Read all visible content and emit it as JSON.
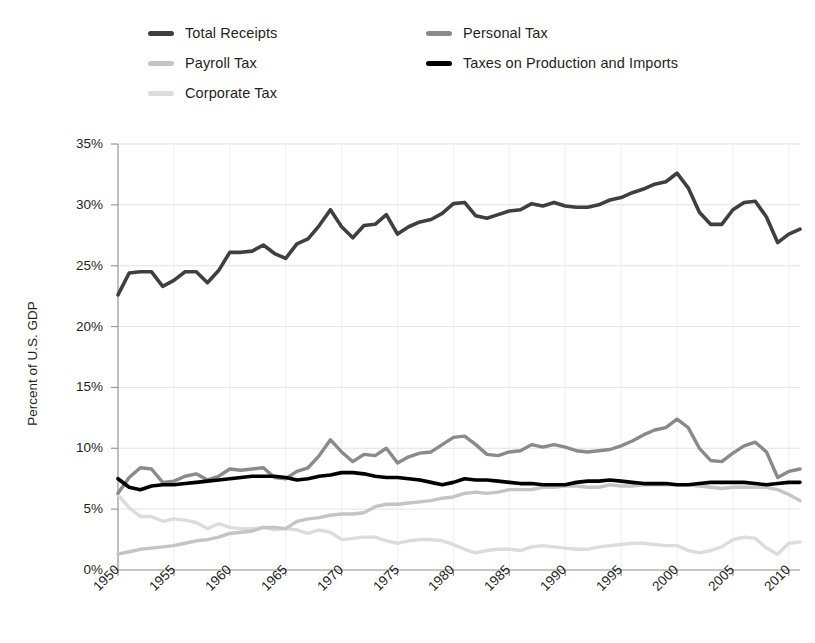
{
  "chart_data": {
    "type": "line",
    "title": "",
    "xlabel": "",
    "ylabel": "Percent of U.S. GDP",
    "xlim": [
      1950,
      2011
    ],
    "ylim": [
      0,
      35
    ],
    "ytick_values": [
      0,
      5,
      10,
      15,
      20,
      25,
      30,
      35
    ],
    "ytick_labels": [
      "0%",
      "5%",
      "10%",
      "15%",
      "20%",
      "25%",
      "30%",
      "35%"
    ],
    "xtick_values": [
      1950,
      1955,
      1960,
      1965,
      1970,
      1975,
      1980,
      1985,
      1990,
      1995,
      2000,
      2005,
      2010
    ],
    "xtick_labels": [
      "1950",
      "1955",
      "1960",
      "1965",
      "1970",
      "1975",
      "1980",
      "1985",
      "1990",
      "1995",
      "2000",
      "2005",
      "2010"
    ],
    "grid": true,
    "legend_position": "top",
    "x": [
      1950,
      1951,
      1952,
      1953,
      1954,
      1955,
      1956,
      1957,
      1958,
      1959,
      1960,
      1961,
      1962,
      1963,
      1964,
      1965,
      1966,
      1967,
      1968,
      1969,
      1970,
      1971,
      1972,
      1973,
      1974,
      1975,
      1976,
      1977,
      1978,
      1979,
      1980,
      1981,
      1982,
      1983,
      1984,
      1985,
      1986,
      1987,
      1988,
      1989,
      1990,
      1991,
      1992,
      1993,
      1994,
      1995,
      1996,
      1997,
      1998,
      1999,
      2000,
      2001,
      2002,
      2003,
      2004,
      2005,
      2006,
      2007,
      2008,
      2009,
      2010,
      2011
    ],
    "series": [
      {
        "name": "Total Receipts",
        "color": "#3f3f3f",
        "width": 3.6,
        "values": [
          22.6,
          24.4,
          24.5,
          24.5,
          23.3,
          23.8,
          24.5,
          24.5,
          23.6,
          24.6,
          26.1,
          26.1,
          26.2,
          26.7,
          26.0,
          25.6,
          26.8,
          27.2,
          28.3,
          29.6,
          28.2,
          27.3,
          28.3,
          28.4,
          29.2,
          27.6,
          28.2,
          28.6,
          28.8,
          29.3,
          30.1,
          30.2,
          29.1,
          28.9,
          29.2,
          29.5,
          29.6,
          30.1,
          29.9,
          30.2,
          29.9,
          29.8,
          29.8,
          30.0,
          30.4,
          30.6,
          31.0,
          31.3,
          31.7,
          31.9,
          32.6,
          31.4,
          29.4,
          28.4,
          28.4,
          29.6,
          30.2,
          30.3,
          29.0,
          26.9,
          27.6,
          28.0
        ]
      },
      {
        "name": "Personal Tax",
        "color": "#8a8a8a",
        "width": 3.4,
        "values": [
          6.3,
          7.6,
          8.4,
          8.3,
          7.2,
          7.3,
          7.7,
          7.9,
          7.4,
          7.7,
          8.3,
          8.2,
          8.3,
          8.4,
          7.6,
          7.5,
          8.1,
          8.4,
          9.4,
          10.7,
          9.7,
          8.9,
          9.5,
          9.4,
          10.0,
          8.8,
          9.3,
          9.6,
          9.7,
          10.3,
          10.9,
          11.0,
          10.3,
          9.5,
          9.4,
          9.7,
          9.8,
          10.3,
          10.1,
          10.3,
          10.1,
          9.8,
          9.7,
          9.8,
          9.9,
          10.2,
          10.6,
          11.1,
          11.5,
          11.7,
          12.4,
          11.7,
          10.0,
          9.0,
          8.9,
          9.6,
          10.2,
          10.5,
          9.7,
          7.6,
          8.1,
          8.3
        ]
      },
      {
        "name": "Payroll Tax",
        "color": "#c4c4c4",
        "width": 3.4,
        "values": [
          1.3,
          1.5,
          1.7,
          1.8,
          1.9,
          2.0,
          2.2,
          2.4,
          2.5,
          2.7,
          3.0,
          3.1,
          3.2,
          3.5,
          3.5,
          3.4,
          4.0,
          4.2,
          4.3,
          4.5,
          4.6,
          4.6,
          4.7,
          5.2,
          5.4,
          5.4,
          5.5,
          5.6,
          5.7,
          5.9,
          6.0,
          6.3,
          6.4,
          6.3,
          6.4,
          6.6,
          6.6,
          6.6,
          6.8,
          6.8,
          6.9,
          6.9,
          6.8,
          6.8,
          7.0,
          6.9,
          6.9,
          7.0,
          7.0,
          7.0,
          7.0,
          7.0,
          6.9,
          6.8,
          6.7,
          6.8,
          6.8,
          6.8,
          6.8,
          6.6,
          6.2,
          5.7
        ]
      },
      {
        "name": "Corporate Tax",
        "color": "#dcdcdc",
        "width": 3.4,
        "values": [
          6.2,
          5.1,
          4.4,
          4.4,
          4.0,
          4.2,
          4.1,
          3.9,
          3.4,
          3.8,
          3.5,
          3.4,
          3.4,
          3.5,
          3.3,
          3.4,
          3.3,
          3.0,
          3.3,
          3.1,
          2.5,
          2.6,
          2.7,
          2.7,
          2.4,
          2.2,
          2.4,
          2.5,
          2.5,
          2.4,
          2.1,
          1.7,
          1.4,
          1.6,
          1.7,
          1.7,
          1.6,
          1.9,
          2.0,
          1.9,
          1.8,
          1.7,
          1.7,
          1.9,
          2.0,
          2.1,
          2.2,
          2.2,
          2.1,
          2.0,
          2.0,
          1.6,
          1.4,
          1.6,
          1.9,
          2.5,
          2.7,
          2.6,
          1.8,
          1.3,
          2.2,
          2.3
        ]
      },
      {
        "name": "Taxes on Production and Imports",
        "color": "#000000",
        "width": 3.6,
        "values": [
          7.5,
          6.8,
          6.6,
          6.9,
          7.0,
          7.0,
          7.1,
          7.2,
          7.3,
          7.4,
          7.5,
          7.6,
          7.7,
          7.7,
          7.7,
          7.6,
          7.4,
          7.5,
          7.7,
          7.8,
          8.0,
          8.0,
          7.9,
          7.7,
          7.6,
          7.6,
          7.5,
          7.4,
          7.2,
          7.0,
          7.2,
          7.5,
          7.4,
          7.4,
          7.3,
          7.2,
          7.1,
          7.1,
          7.0,
          7.0,
          7.0,
          7.2,
          7.3,
          7.3,
          7.4,
          7.3,
          7.2,
          7.1,
          7.1,
          7.1,
          7.0,
          7.0,
          7.1,
          7.2,
          7.2,
          7.2,
          7.2,
          7.1,
          7.0,
          7.1,
          7.2,
          7.2
        ]
      }
    ]
  },
  "legend": {
    "items": [
      {
        "label": "Total Receipts",
        "color": "#3f3f3f",
        "col": 0,
        "row": 0
      },
      {
        "label": "Payroll Tax",
        "color": "#c4c4c4",
        "col": 0,
        "row": 1
      },
      {
        "label": "Corporate Tax",
        "color": "#dcdcdc",
        "col": 0,
        "row": 2
      },
      {
        "label": "Personal Tax",
        "color": "#8a8a8a",
        "col": 1,
        "row": 0
      },
      {
        "label": "Taxes on Production and Imports",
        "color": "#000000",
        "col": 1,
        "row": 1
      }
    ]
  },
  "axes": {
    "y_title": "Percent of U.S. GDP",
    "grid_color": "#e3e3e3",
    "spine_color": "#9a9a9a",
    "text_color": "#231f20"
  }
}
